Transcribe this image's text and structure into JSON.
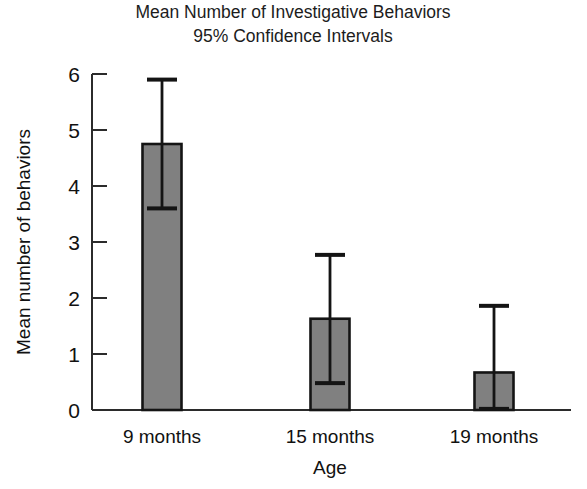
{
  "chart_data": {
    "type": "bar",
    "title": "Mean Number of Investigative Behaviors",
    "subtitle": "95% Confidence Intervals",
    "xlabel": "Age",
    "ylabel": "Mean number of behaviors",
    "categories": [
      "9 months",
      "15 months",
      "19 months"
    ],
    "values": [
      4.75,
      1.63,
      0.67
    ],
    "error_low": [
      3.6,
      0.48,
      0.02
    ],
    "error_high": [
      5.9,
      2.77,
      1.86
    ],
    "ylim": [
      0,
      6
    ],
    "ytick_labels": [
      "0",
      "1",
      "2",
      "3",
      "4",
      "5",
      "6"
    ],
    "ytick_values": [
      0,
      1,
      2,
      3,
      4,
      5,
      6
    ],
    "grid": false,
    "legend": "none",
    "bar_fill_color": "#808080",
    "bar_edge_color": "#141414",
    "error_bar_color": "#141414",
    "axis_color": "#2b2b2b",
    "background_color": "#ffffff",
    "error_bar_kind": "95% confidence interval"
  },
  "figure": {
    "title_line1": "Mean Number of Investigative Behaviors",
    "title_line2": "95% Confidence Intervals",
    "y_axis_title": "Mean number of behaviors",
    "x_axis_title": "Age",
    "y_ticks": [
      {
        "label": "6",
        "value": 6
      },
      {
        "label": "5",
        "value": 5
      },
      {
        "label": "4",
        "value": 4
      },
      {
        "label": "3",
        "value": 3
      },
      {
        "label": "2",
        "value": 2
      },
      {
        "label": "1",
        "value": 1
      },
      {
        "label": "0",
        "value": 0
      }
    ],
    "x_ticks": [
      {
        "label": "9 months"
      },
      {
        "label": "15 months"
      },
      {
        "label": "19 months"
      }
    ]
  }
}
